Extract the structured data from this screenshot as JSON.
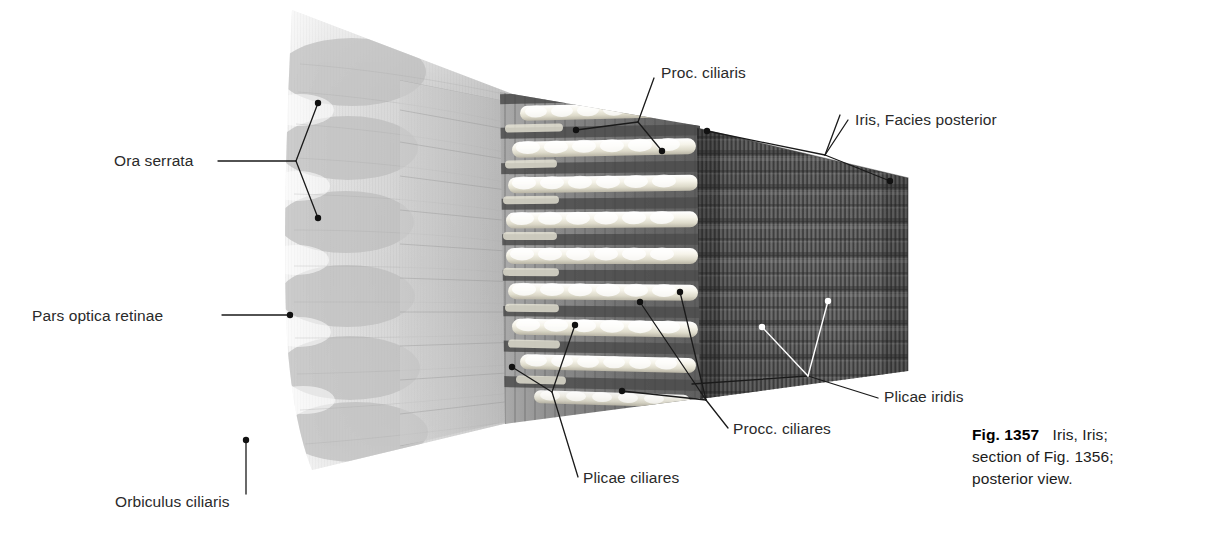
{
  "figure": {
    "title_number": "Fig. 1357",
    "caption_lines": [
      "Iris, Iris;",
      "section of Fig. 1356;",
      "posterior view."
    ]
  },
  "labels": {
    "ora_serrata": "Ora serrata",
    "pars_optica_retinae": "Pars optica retinae",
    "orbiculus_ciliaris": "Orbiculus ciliaris",
    "plicae_ciliares": "Plicae ciliares",
    "procc_ciliares": "Procc. ciliares",
    "proc_ciliaris": "Proc. ciliaris",
    "iris_facies_posterior": "Iris, Facies posterior",
    "plicae_iridis": "Plicae iridis"
  },
  "colors": {
    "background": "#ffffff",
    "leader_dark": "#1a1a1a",
    "leader_light": "#ffffff",
    "retina_light": "#e6e6e6",
    "retina_mid": "#c9c9c9",
    "orbiculus": "#b9b9b9",
    "ciliary_dark": "#6e6e6e",
    "ciliary_process": "#f2f0e6",
    "iris_dark": "#565656",
    "iris_rib": "#3a3a3a",
    "text": "#2a2a2a"
  },
  "label_positions": {
    "ora_serrata": {
      "left": 114,
      "top": 152
    },
    "pars_optica_retinae": {
      "left": 32,
      "top": 307
    },
    "orbiculus_ciliaris": {
      "left": 115,
      "top": 493
    },
    "plicae_ciliares": {
      "left": 583,
      "top": 468
    },
    "procc_ciliares": {
      "left": 733,
      "top": 420
    },
    "proc_ciliaris": {
      "left": 661,
      "top": 64
    },
    "iris_facies_posterior": {
      "left": 855,
      "top": 111
    },
    "plicae_iridis": {
      "left": 884,
      "top": 387
    }
  }
}
